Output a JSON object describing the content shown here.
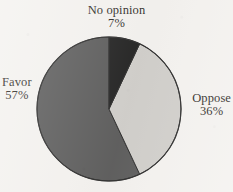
{
  "chart_data": {
    "type": "pie",
    "title": "",
    "subtitle": "",
    "xlabel": "",
    "ylabel": "",
    "legend_position": "none",
    "grid": false,
    "start_angle_deg": 0,
    "direction": "clockwise",
    "unit": "%",
    "categories": [
      "No opinion",
      "Oppose",
      "Favor"
    ],
    "values": [
      7,
      36,
      57
    ],
    "slices": [
      {
        "label": "No opinion",
        "value": 7,
        "value_text": "7%",
        "color": "#0d0d0d",
        "start_deg": 0,
        "end_deg": 25.2,
        "label_position": "top"
      },
      {
        "label": "Oppose",
        "value": 36,
        "value_text": "36%",
        "color": "#cccac6",
        "start_deg": 25.2,
        "end_deg": 154.8,
        "label_position": "right"
      },
      {
        "label": "Favor",
        "value": 57,
        "value_text": "57%",
        "color": "#4c4c4c",
        "start_deg": 154.8,
        "end_deg": 360,
        "label_position": "left"
      }
    ],
    "geometry": {
      "center_x": 109,
      "center_y": 109,
      "radius": 72
    },
    "colors": {
      "background": "#f3f1ee",
      "outline": "#1a1a1a",
      "text": "#17140f",
      "no_opinion": "#0d0d0d",
      "oppose": "#cccac6",
      "favor": "#4c4c4c"
    }
  }
}
